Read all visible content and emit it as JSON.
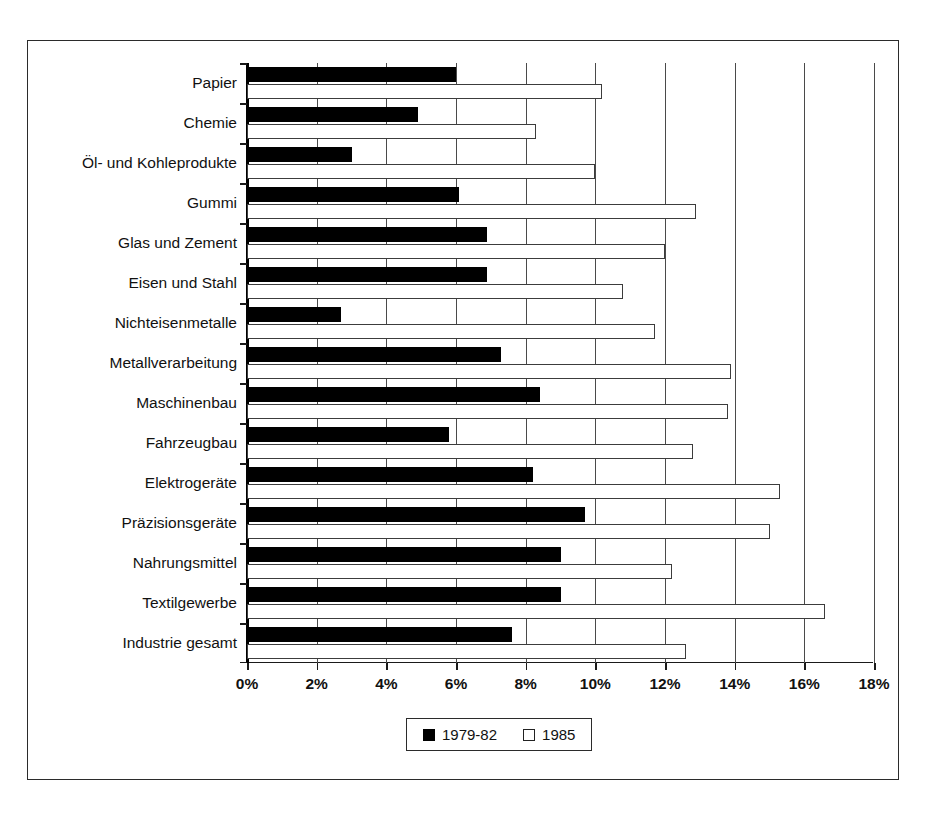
{
  "chart_data": {
    "type": "bar",
    "orientation": "horizontal",
    "title": "",
    "subtitle": "",
    "xlabel": "",
    "ylabel": "",
    "xlim": [
      0,
      18
    ],
    "xticks": [
      "0%",
      "2%",
      "4%",
      "6%",
      "8%",
      "10%",
      "12%",
      "14%",
      "16%",
      "18%"
    ],
    "xtick_values": [
      0,
      2,
      4,
      6,
      8,
      10,
      12,
      14,
      16,
      18
    ],
    "grid": "vertical",
    "legend_position": "bottom-center",
    "categories": [
      "Papier",
      "Chemie",
      "Öl- und Kohleprodukte",
      "Gummi",
      "Glas und Zement",
      "Eisen und Stahl",
      "Nichteisenmetalle",
      "Metallverarbeitung",
      "Maschinenbau",
      "Fahrzeugbau",
      "Elektrogeräte",
      "Präzisionsgeräte",
      "Nahrungsmittel",
      "Textilgewerbe",
      "Industrie gesamt"
    ],
    "series": [
      {
        "name": "1979-82",
        "color": "#000000",
        "style": "filled",
        "values": [
          6.0,
          4.9,
          3.0,
          6.1,
          6.9,
          6.9,
          2.7,
          7.3,
          8.4,
          5.8,
          8.2,
          9.7,
          9.0,
          9.0,
          7.6
        ]
      },
      {
        "name": "1985",
        "color": "#ffffff",
        "style": "hollow",
        "values": [
          10.2,
          8.3,
          10.0,
          12.9,
          12.0,
          10.8,
          11.7,
          13.9,
          13.8,
          12.8,
          15.3,
          15.0,
          12.2,
          16.6,
          12.6
        ]
      }
    ]
  },
  "legend": {
    "items": [
      {
        "label": "1979-82",
        "style": "filled"
      },
      {
        "label": "1985",
        "style": "hollow"
      }
    ]
  },
  "colors": {
    "series_1979_82": "#000000",
    "series_1985": "#ffffff",
    "axis": "#1a1a1a",
    "grid": "#4a4a4a",
    "frame": "#2b2b2b",
    "background": "#ffffff"
  }
}
